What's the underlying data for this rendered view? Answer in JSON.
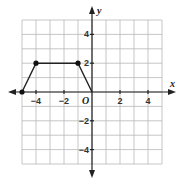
{
  "chart_data": {
    "type": "line",
    "title": "",
    "xlabel": "x",
    "ylabel": "y",
    "origin_label": "O",
    "xlim": [
      -5,
      5
    ],
    "ylim": [
      -5,
      5
    ],
    "grid": true,
    "grid_step": 1,
    "x_ticks": [
      -4,
      -2,
      2,
      4
    ],
    "x_tick_labels": [
      "−4",
      "−2",
      "2",
      "4"
    ],
    "y_ticks": [
      4,
      2,
      -2,
      -4
    ],
    "y_tick_labels": [
      "4",
      "2",
      "−2",
      "−4"
    ],
    "series": [
      {
        "name": "trapezoid",
        "points": [
          [
            -5,
            0
          ],
          [
            -4,
            2
          ],
          [
            -1,
            2
          ],
          [
            0,
            0
          ]
        ],
        "marked_points": [
          [
            -5,
            0
          ],
          [
            -4,
            2
          ],
          [
            -1,
            2
          ]
        ]
      }
    ],
    "colors": {
      "grid": "#b8b8b8",
      "axis": "#222222",
      "shape": "#222222"
    }
  }
}
